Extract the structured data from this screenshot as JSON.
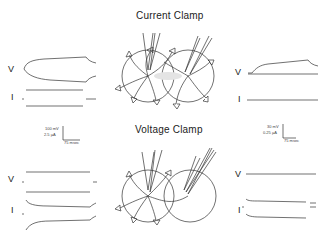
{
  "panels": {
    "current_clamp": {
      "title": "Current Clamp",
      "left_traces": {
        "v_label": "V",
        "i_label": "I"
      },
      "right_traces": {
        "v_label": "V",
        "i_label": "I"
      }
    },
    "voltage_clamp": {
      "title": "Voltage Clamp",
      "left_traces": {
        "v_label": "V",
        "i_label": "I"
      },
      "right_traces": {
        "v_label": "V",
        "i_label": "I"
      }
    }
  },
  "scale_bars": {
    "left": {
      "voltage": "100 mV",
      "current": "2.5 µA",
      "time": "75 msec"
    },
    "right": {
      "voltage": "30 mV",
      "current": "0.25 µA",
      "time": "75 msec"
    }
  },
  "colors": {
    "ink": "#333333",
    "background": "#ffffff"
  }
}
